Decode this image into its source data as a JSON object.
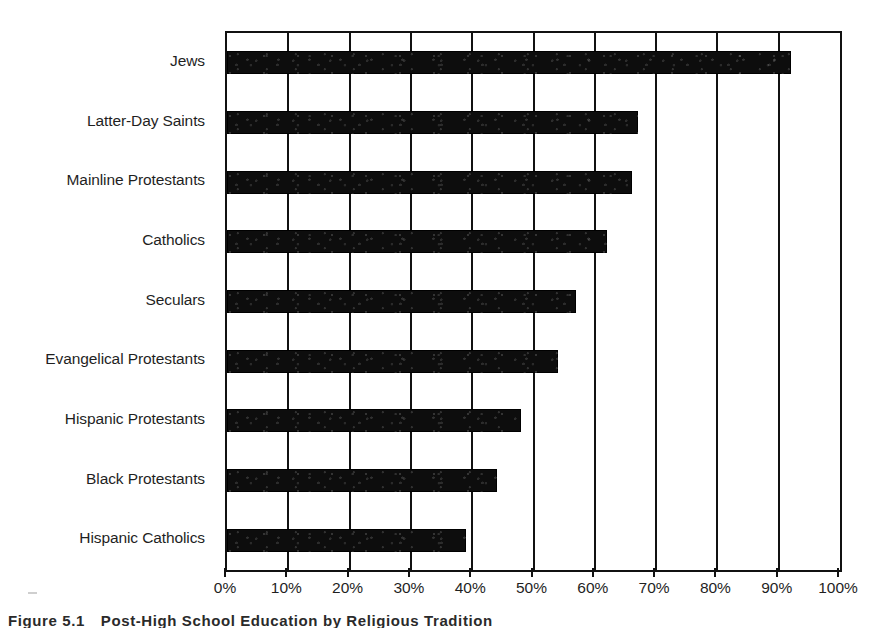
{
  "chart_data": {
    "type": "bar",
    "orientation": "horizontal",
    "title": "",
    "xlabel": "",
    "ylabel": "",
    "xlim": [
      0,
      100
    ],
    "grid": true,
    "legend": "none",
    "categories": [
      "Jews",
      "Latter-Day Saints",
      "Mainline Protestants",
      "Catholics",
      "Seculars",
      "Evangelical Protestants",
      "Hispanic Protestants",
      "Black Protestants",
      "Hispanic Catholics"
    ],
    "values": [
      92,
      67,
      66,
      62,
      57,
      54,
      48,
      44,
      39
    ],
    "tick_labels": [
      "0%",
      "10%",
      "20%",
      "30%",
      "40%",
      "50%",
      "60%",
      "70%",
      "80%",
      "90%",
      "100%"
    ],
    "tick_values": [
      0,
      10,
      20,
      30,
      40,
      50,
      60,
      70,
      80,
      90,
      100
    ],
    "bar_color": "#0d0d0d",
    "axis_color": "#111111"
  },
  "caption": {
    "number": "Figure 5.1",
    "text": "Post-High School Education by Religious Tradition"
  }
}
